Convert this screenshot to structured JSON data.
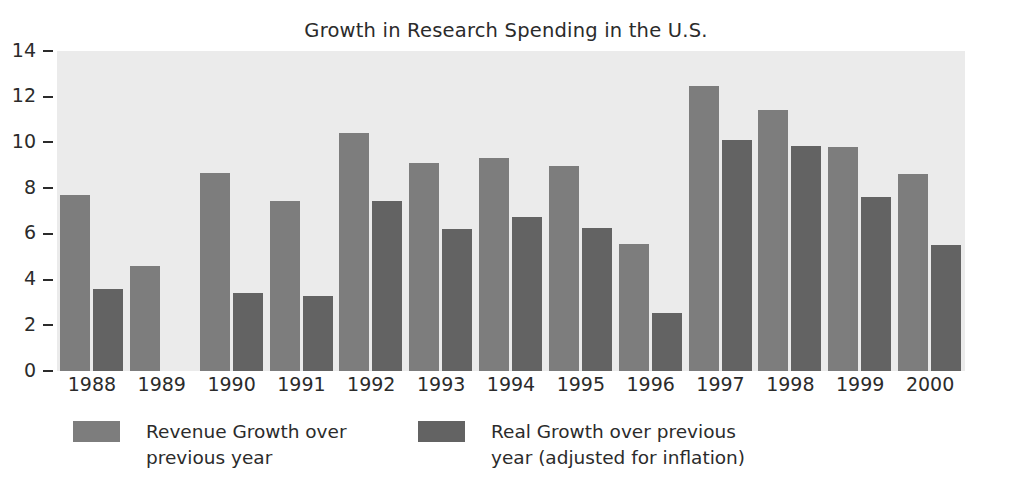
{
  "chart_data": {
    "type": "bar",
    "title": "Growth in Research Spending in the U.S.",
    "xlabel": "",
    "ylabel": "",
    "ylim": [
      0,
      14
    ],
    "yticks": [
      0,
      2,
      4,
      6,
      8,
      10,
      12,
      14
    ],
    "ytick_labels": [
      "0",
      "2",
      "4",
      "6",
      "8",
      "10",
      "12",
      "14"
    ],
    "grid": false,
    "legend_position": "bottom",
    "categories": [
      "1988",
      "1989",
      "1990",
      "1991",
      "1992",
      "1993",
      "1994",
      "1995",
      "1996",
      "1997",
      "1998",
      "1999",
      "2000"
    ],
    "series": [
      {
        "name": "Revenue Growth over previous year",
        "color": "#7d7d7d",
        "values": [
          7.7,
          4.6,
          8.65,
          7.45,
          10.4,
          9.1,
          9.3,
          8.95,
          5.55,
          12.45,
          11.4,
          9.8,
          8.6
        ]
      },
      {
        "name": "Real Growth over previous year (adjusted for inflation)",
        "color": "#636363",
        "values": [
          3.6,
          null,
          3.4,
          3.3,
          7.45,
          6.2,
          6.75,
          6.25,
          2.55,
          10.1,
          9.85,
          7.6,
          5.5
        ]
      }
    ]
  },
  "legend": {
    "entries": [
      {
        "label": "Revenue Growth over\nprevious year",
        "color": "#7d7d7d"
      },
      {
        "label": "Real Growth over previous\nyear (adjusted for inflation)",
        "color": "#636363"
      }
    ]
  },
  "style": {
    "plot_background": "#ebebeb",
    "figure_background": "#ffffff",
    "axis_text_color": "#2b2b2b"
  }
}
